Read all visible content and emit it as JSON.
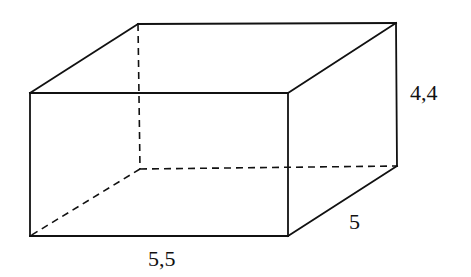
{
  "diagram": {
    "type": "rectangular-prism",
    "stroke_color": "#111111",
    "background_color": "#ffffff",
    "vertices": {
      "front_top_left": [
        30,
        93
      ],
      "front_top_right": [
        288,
        93
      ],
      "front_bottom_left": [
        30,
        236
      ],
      "front_bottom_right": [
        288,
        236
      ],
      "back_top_left": [
        138,
        24
      ],
      "back_top_right": [
        396,
        23
      ],
      "back_bottom_left": [
        140,
        169
      ],
      "back_bottom_right": [
        397,
        166
      ]
    },
    "visible_edges": [
      [
        "front_top_left",
        "front_top_right"
      ],
      [
        "front_top_right",
        "front_bottom_right"
      ],
      [
        "front_bottom_right",
        "front_bottom_left"
      ],
      [
        "front_bottom_left",
        "front_top_left"
      ],
      [
        "front_top_left",
        "back_top_left"
      ],
      [
        "back_top_left",
        "back_top_right"
      ],
      [
        "front_top_right",
        "back_top_right"
      ],
      [
        "back_top_right",
        "back_bottom_right"
      ],
      [
        "front_bottom_right",
        "back_bottom_right"
      ]
    ],
    "hidden_edges": [
      [
        "back_top_left",
        "back_bottom_left"
      ],
      [
        "back_bottom_left",
        "back_bottom_right"
      ],
      [
        "back_bottom_left",
        "front_bottom_left"
      ]
    ],
    "labels": {
      "height": "4,4",
      "depth": "5",
      "width": "5,5"
    }
  }
}
